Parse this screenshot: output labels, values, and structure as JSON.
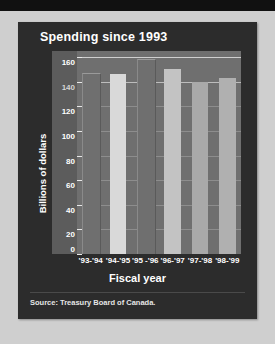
{
  "panel": {
    "title": "Spending since 1993",
    "source": "Source: Treasury Board of Canada."
  },
  "chart_data": {
    "type": "bar",
    "title": "Spending since 1993",
    "xlabel": "Fiscal year",
    "ylabel": "Billions of dollars",
    "categories": [
      "'93-'94",
      "'94-'95",
      "'95 -'96",
      "'96-'97",
      "'97-'98",
      "'98-'99"
    ],
    "values": [
      146,
      146,
      158,
      150,
      140,
      143
    ],
    "bar_shades": [
      "#6f6f6f",
      "#d9d9d9",
      "#6f6f6f",
      "#c3c3c3",
      "#a9a9a9",
      "#b0b0b0"
    ],
    "ylim": [
      0,
      165
    ],
    "yticks": [
      0,
      20,
      40,
      60,
      80,
      100,
      120,
      140,
      160
    ],
    "gridlines": [
      20,
      40,
      60,
      80,
      100,
      120,
      140,
      160
    ],
    "grid": true,
    "legend": "none",
    "series": [
      {
        "name": "Spending",
        "values": [
          146,
          146,
          158,
          150,
          140,
          143
        ]
      }
    ]
  }
}
